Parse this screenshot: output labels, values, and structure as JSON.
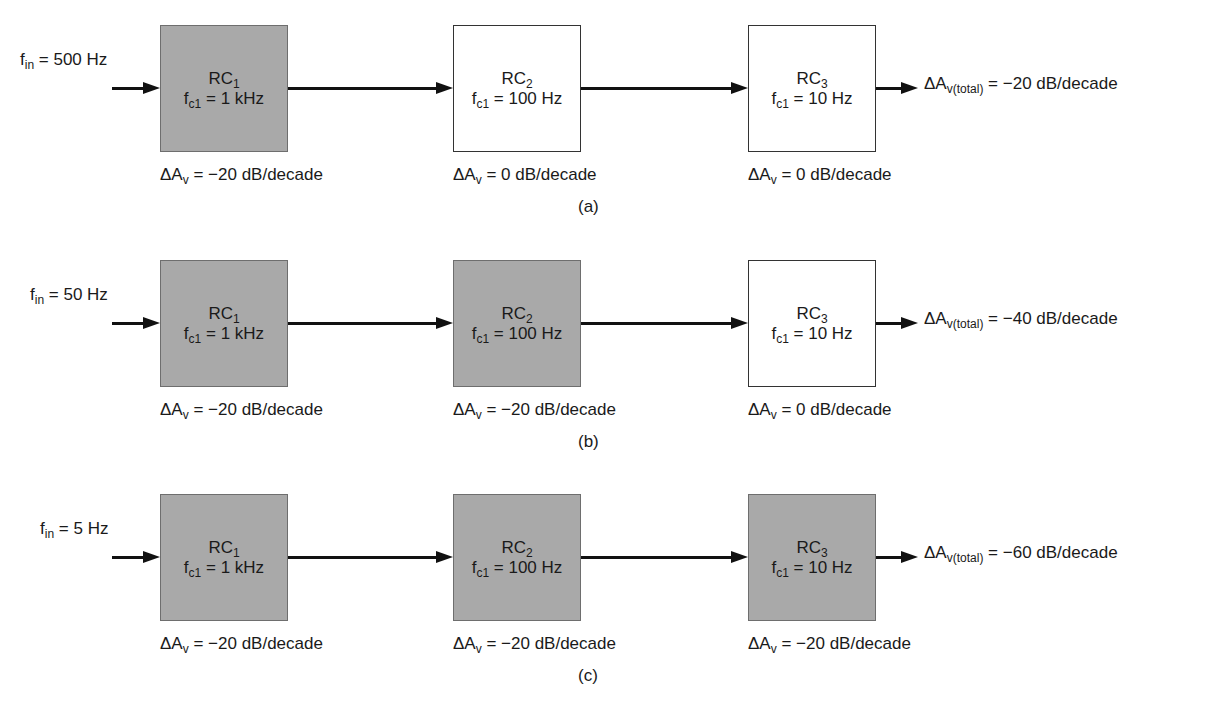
{
  "figure": {
    "rows": [
      {
        "id": "a",
        "caption": "(a)",
        "input": {
          "symbol": "f",
          "sub": "in",
          "value": " = 500 Hz"
        },
        "stages": [
          {
            "name": "RC",
            "index": "1",
            "fc_sym": "f",
            "fc_sub": "c1",
            "fc_val": " = 1 kHz",
            "shaded": true,
            "gain_sym": "ΔA",
            "gain_sub": "v",
            "gain_val": " = −20 dB/decade"
          },
          {
            "name": "RC",
            "index": "2",
            "fc_sym": "f",
            "fc_sub": "c1",
            "fc_val": " = 100 Hz",
            "shaded": false,
            "gain_sym": "ΔA",
            "gain_sub": "v",
            "gain_val": " = 0 dB/decade"
          },
          {
            "name": "RC",
            "index": "3",
            "fc_sym": "f",
            "fc_sub": "c1",
            "fc_val": " = 10 Hz",
            "shaded": false,
            "gain_sym": "ΔA",
            "gain_sub": "v",
            "gain_val": " = 0 dB/decade"
          }
        ],
        "total": {
          "symbol": "ΔA",
          "sub": "v(total)",
          "value": " = −20 dB/decade"
        }
      },
      {
        "id": "b",
        "caption": "(b)",
        "input": {
          "symbol": "f",
          "sub": "in",
          "value": " = 50 Hz"
        },
        "stages": [
          {
            "name": "RC",
            "index": "1",
            "fc_sym": "f",
            "fc_sub": "c1",
            "fc_val": " = 1 kHz",
            "shaded": true,
            "gain_sym": "ΔA",
            "gain_sub": "v",
            "gain_val": " = −20 dB/decade"
          },
          {
            "name": "RC",
            "index": "2",
            "fc_sym": "f",
            "fc_sub": "c1",
            "fc_val": " = 100 Hz",
            "shaded": true,
            "gain_sym": "ΔA",
            "gain_sub": "v",
            "gain_val": " = −20 dB/decade"
          },
          {
            "name": "RC",
            "index": "3",
            "fc_sym": "f",
            "fc_sub": "c1",
            "fc_val": " = 10 Hz",
            "shaded": false,
            "gain_sym": "ΔA",
            "gain_sub": "v",
            "gain_val": " = 0 dB/decade"
          }
        ],
        "total": {
          "symbol": "ΔA",
          "sub": "v(total)",
          "value": " = −40 dB/decade"
        }
      },
      {
        "id": "c",
        "caption": "(c)",
        "input": {
          "symbol": "f",
          "sub": "in",
          "value": " = 5 Hz"
        },
        "stages": [
          {
            "name": "RC",
            "index": "1",
            "fc_sym": "f",
            "fc_sub": "c1",
            "fc_val": " = 1 kHz",
            "shaded": true,
            "gain_sym": "ΔA",
            "gain_sub": "v",
            "gain_val": " = −20 dB/decade"
          },
          {
            "name": "RC",
            "index": "2",
            "fc_sym": "f",
            "fc_sub": "c1",
            "fc_val": " = 100 Hz",
            "shaded": true,
            "gain_sym": "ΔA",
            "gain_sub": "v",
            "gain_val": " = −20 dB/decade"
          },
          {
            "name": "RC",
            "index": "3",
            "fc_sym": "f",
            "fc_sub": "c1",
            "fc_val": " = 10 Hz",
            "shaded": true,
            "gain_sym": "ΔA",
            "gain_sub": "v",
            "gain_val": " = −20 dB/decade"
          }
        ],
        "total": {
          "symbol": "ΔA",
          "sub": "v(total)",
          "value": " = −60 dB/decade"
        }
      }
    ],
    "colors": {
      "shaded_fill": "#a9a9a9",
      "line": "#111111",
      "background": "#ffffff"
    }
  }
}
